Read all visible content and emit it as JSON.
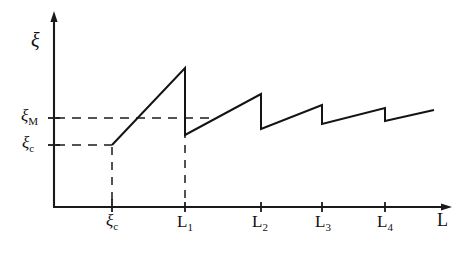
{
  "figure": {
    "name": "correlation-length-vs-system-size",
    "background_color": "#ffffff",
    "ink_color": "#1a1a1a"
  },
  "axes": {
    "y_axis_label": "ξ",
    "x_axis_label": "L",
    "y_tick_labels": [
      {
        "id": "xi-m",
        "base": "ξ",
        "sub": "M",
        "y_px": 118
      },
      {
        "id": "xi-c",
        "base": "ξ",
        "sub": "c",
        "y_px": 145
      }
    ],
    "x_tick_labels": [
      {
        "id": "xi-c",
        "base": "ξ",
        "sub": "c",
        "x_px": 112
      },
      {
        "id": "l1",
        "base": "L",
        "sub": "1",
        "x_px": 185
      },
      {
        "id": "l2",
        "base": "L",
        "sub": "2",
        "x_px": 261
      },
      {
        "id": "l3",
        "base": "L",
        "sub": "3",
        "x_px": 322
      },
      {
        "id": "l4",
        "base": "L",
        "sub": "4",
        "x_px": 385
      }
    ],
    "origin": {
      "x": 54,
      "y": 207
    },
    "x_axis_end": 452,
    "y_axis_top": 14
  },
  "chart_data": {
    "type": "line",
    "title": "",
    "xlabel": "L",
    "ylabel": "ξ",
    "grid": false,
    "legend": null,
    "xlim": [
      0,
      452
    ],
    "ylim": [
      0,
      207
    ],
    "reference_lines": [
      {
        "name": "xi-M-level",
        "label": "ξ_M",
        "orientation": "horizontal",
        "y": 118,
        "x_start": 54,
        "x_end": 212,
        "style": "dashed"
      },
      {
        "name": "xi-c-level",
        "label": "ξ_c",
        "orientation": "horizontal",
        "y": 145,
        "x_start": 54,
        "x_end": 112,
        "style": "dashed"
      },
      {
        "name": "xi-c-drop",
        "label": "ξ_c",
        "orientation": "vertical",
        "x": 112,
        "y_start": 145,
        "y_end": 207,
        "style": "dashed"
      },
      {
        "name": "L1-drop",
        "label": "L_1",
        "orientation": "vertical",
        "x": 185,
        "y_start": 68,
        "y_end": 207,
        "style": "dashed"
      }
    ],
    "segments": [
      {
        "name": "initial-ramp",
        "points": [
          [
            112,
            145
          ],
          [
            185,
            68
          ]
        ]
      },
      {
        "name": "drop-1",
        "points": [
          [
            185,
            68
          ],
          [
            185,
            135
          ]
        ]
      },
      {
        "name": "ramp-2",
        "points": [
          [
            185,
            135
          ],
          [
            261,
            94
          ]
        ]
      },
      {
        "name": "drop-2",
        "points": [
          [
            261,
            94
          ],
          [
            261,
            129
          ]
        ]
      },
      {
        "name": "ramp-3",
        "points": [
          [
            261,
            129
          ],
          [
            322,
            105
          ]
        ]
      },
      {
        "name": "drop-3",
        "points": [
          [
            322,
            105
          ],
          [
            322,
            124
          ]
        ]
      },
      {
        "name": "ramp-4",
        "points": [
          [
            322,
            124
          ],
          [
            385,
            108
          ]
        ]
      },
      {
        "name": "drop-4",
        "points": [
          [
            385,
            108
          ],
          [
            385,
            121
          ]
        ]
      },
      {
        "name": "ramp-5",
        "points": [
          [
            385,
            121
          ],
          [
            434,
            110
          ]
        ]
      }
    ],
    "peaks": [
      {
        "at": "L_1",
        "x": 185,
        "y": 68
      },
      {
        "at": "L_2",
        "x": 261,
        "y": 94
      },
      {
        "at": "L_3",
        "x": 322,
        "y": 105
      },
      {
        "at": "L_4",
        "x": 385,
        "y": 108
      }
    ],
    "troughs": [
      {
        "after": "L_1",
        "x": 185,
        "y": 135
      },
      {
        "after": "L_2",
        "x": 261,
        "y": 129
      },
      {
        "after": "L_3",
        "x": 322,
        "y": 124
      },
      {
        "after": "L_4",
        "x": 385,
        "y": 121
      }
    ]
  }
}
